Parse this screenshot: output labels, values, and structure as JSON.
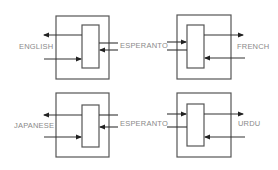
{
  "diagram": {
    "title": "",
    "colors": {
      "stroke": "#555555",
      "text": "#8a8a8a",
      "background": "#ffffff"
    },
    "modules": [
      {
        "id": "top-left",
        "left_label": "ENGLISH",
        "right_label": "ESPERANTO"
      },
      {
        "id": "top-right",
        "left_label": "ESPERANTO",
        "right_label": "FRENCH"
      },
      {
        "id": "bottom-left",
        "left_label": "JAPANESE",
        "right_label": "ESPERANTO"
      },
      {
        "id": "bottom-right",
        "left_label": "ESPERANTO",
        "right_label": "URDU"
      }
    ],
    "labels": {
      "english": "ENGLISH",
      "esperanto_top": "ESPERANTO",
      "french": "FRENCH",
      "japanese": "JAPANESE",
      "esperanto_bottom": "ESPERANTO",
      "urdu": "URDU"
    }
  }
}
